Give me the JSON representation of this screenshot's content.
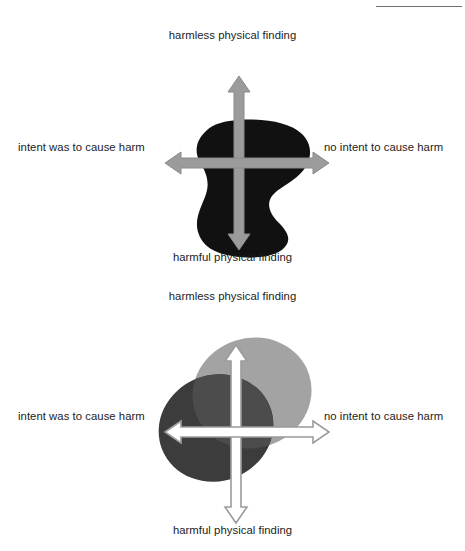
{
  "page": {
    "background_color": "#ffffff",
    "top_artifact_text": "  ",
    "top_artifact_text2": "   ",
    "rule_color": "#6f6f6f"
  },
  "colors": {
    "axis_stroke": "#9b9b9b",
    "axis_fill_diagram1": "#9b9b9b",
    "axis_fill_diagram2": "#ffffff",
    "blob_black": "#111111",
    "ellipse_light": "#a3a3a3",
    "ellipse_dark": "#3c3c3c",
    "ellipse_overlap": "#4c4c4c",
    "label_text": "#1c1c1c"
  },
  "diagrams": [
    {
      "id": "diagram-1",
      "name": "black-blob-quadrant-diagram",
      "axis_labels": {
        "top": "harmless physical finding",
        "bottom": "harmful physical finding",
        "left": "intent was to cause harm",
        "right": "no intent to cause harm"
      },
      "shapes": [
        {
          "name": "black-region",
          "type": "blob",
          "fill": "#111111",
          "description": "single irregular kidney-shaped black region spanning all four quadrants with a concave notch on the right side"
        }
      ]
    },
    {
      "id": "diagram-2",
      "name": "overlapping-ellipses-quadrant-diagram",
      "axis_labels": {
        "top": "harmless physical finding",
        "bottom": "harmful physical finding",
        "left": "intent was to cause harm",
        "right": "no intent to cause harm"
      },
      "shapes": [
        {
          "name": "light-gray-ellipse",
          "type": "ellipse",
          "fill": "#a3a3a3",
          "description": "upper-right tilted ellipse"
        },
        {
          "name": "dark-gray-ellipse",
          "type": "ellipse",
          "fill": "#3c3c3c",
          "description": "lower-left tilted ellipse"
        },
        {
          "name": "ellipse-overlap-region",
          "type": "intersection",
          "fill": "#4c4c4c",
          "description": "intersection of the two ellipses near the origin"
        }
      ]
    }
  ]
}
